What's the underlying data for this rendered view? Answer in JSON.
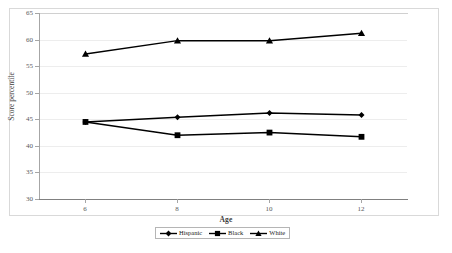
{
  "chart_data": {
    "type": "line",
    "title": "",
    "xlabel": "Age",
    "ylabel": "Score percentile",
    "x": [
      6,
      8,
      10,
      12
    ],
    "xtick_labels": [
      "6",
      "8",
      "10",
      "12"
    ],
    "ytick_labels": [
      "30",
      "35",
      "40",
      "45",
      "50",
      "55",
      "60",
      "65"
    ],
    "ytick_values": [
      30,
      35,
      40,
      45,
      50,
      55,
      60,
      65
    ],
    "ylim": [
      30,
      65
    ],
    "xlim": [
      5,
      13
    ],
    "grid": "horizontal",
    "legend_position": "bottom",
    "series": [
      {
        "name": "Hispanic",
        "marker": "diamond",
        "color": "#000000",
        "values": [
          44.5,
          45.4,
          46.2,
          45.8
        ]
      },
      {
        "name": "Black",
        "marker": "square",
        "color": "#000000",
        "values": [
          44.5,
          42.0,
          42.5,
          41.7
        ]
      },
      {
        "name": "White",
        "marker": "triangle",
        "color": "#000000",
        "values": [
          57.3,
          59.8,
          59.8,
          61.2
        ]
      }
    ]
  },
  "legend": {
    "entries": [
      {
        "label": "Hispanic"
      },
      {
        "label": "Black"
      },
      {
        "label": "White"
      }
    ]
  },
  "axes": {
    "x_title": "Age",
    "y_title": "Score percentile"
  },
  "colors": {
    "series": "#000000",
    "gridline": "#ededed",
    "axis": "#a6a6a6",
    "frame": "#d9d9d9",
    "tick_text": "#58595b",
    "title_text": "#3d3d3d"
  }
}
